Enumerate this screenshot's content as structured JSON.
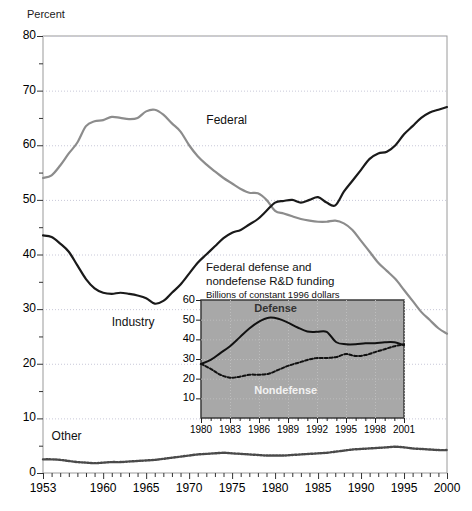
{
  "chart_data": {
    "type": "line",
    "title": "",
    "ylabel": "Percent",
    "xlabel": "",
    "ylim": [
      0,
      80
    ],
    "xlim": [
      1953,
      2000
    ],
    "grid": true,
    "y_ticks": [
      0,
      10,
      20,
      30,
      40,
      50,
      60,
      70,
      80
    ],
    "y_tick_labels": [
      "0",
      "10",
      "20",
      "30",
      "40",
      "50",
      "60",
      "70",
      "80"
    ],
    "x_ticks": [
      1953,
      1960,
      1965,
      1970,
      1975,
      1980,
      1985,
      1990,
      1995,
      2000
    ],
    "x_tick_labels": [
      "1953",
      "1960",
      "1965",
      "1970",
      "1975",
      "1980",
      "1985",
      "1990",
      "1995",
      "2000"
    ],
    "legend_position": "inline-annotation",
    "x": [
      1953,
      1954,
      1955,
      1956,
      1957,
      1958,
      1959,
      1960,
      1961,
      1962,
      1963,
      1964,
      1965,
      1966,
      1967,
      1968,
      1969,
      1970,
      1971,
      1972,
      1973,
      1974,
      1975,
      1976,
      1977,
      1978,
      1979,
      1980,
      1981,
      1982,
      1983,
      1984,
      1985,
      1986,
      1987,
      1988,
      1989,
      1990,
      1991,
      1992,
      1993,
      1994,
      1995,
      1996,
      1997,
      1998,
      1999,
      2000
    ],
    "series": [
      {
        "name": "Federal",
        "color": "#8c8c8c",
        "style": "solid",
        "values": [
          54.0,
          54.5,
          56.3,
          58.5,
          60.5,
          63.5,
          64.4,
          64.6,
          65.2,
          65.0,
          64.8,
          65.0,
          66.2,
          66.5,
          65.6,
          64.0,
          62.5,
          60.0,
          58.0,
          56.5,
          55.2,
          54.0,
          53.0,
          52.0,
          51.3,
          51.2,
          50.0,
          48.0,
          47.5,
          47.0,
          46.5,
          46.2,
          46.0,
          46.0,
          46.2,
          45.7,
          44.5,
          42.5,
          40.5,
          38.5,
          37.0,
          35.5,
          33.5,
          31.5,
          29.5,
          28.0,
          26.5,
          25.5
        ]
      },
      {
        "name": "Industry",
        "color": "#1a1a1a",
        "style": "solid",
        "values": [
          43.5,
          43.2,
          42.0,
          40.5,
          38.0,
          35.5,
          33.8,
          33.0,
          32.8,
          33.0,
          32.8,
          32.5,
          32.0,
          31.0,
          31.5,
          33.0,
          34.5,
          36.5,
          38.5,
          40.0,
          41.5,
          43.0,
          44.0,
          44.5,
          45.5,
          46.5,
          48.0,
          49.5,
          49.8,
          50.0,
          49.5,
          50.0,
          50.5,
          49.5,
          49.0,
          51.5,
          53.5,
          55.5,
          57.5,
          58.5,
          58.8,
          60.0,
          62.0,
          63.5,
          65.0,
          66.0,
          66.5,
          67.0
        ]
      },
      {
        "name": "Other",
        "color": "#4a4a4a",
        "style": "dotted",
        "values": [
          2.5,
          2.5,
          2.4,
          2.2,
          2.0,
          1.9,
          1.8,
          1.9,
          2.0,
          2.0,
          2.1,
          2.2,
          2.3,
          2.4,
          2.6,
          2.8,
          3.0,
          3.2,
          3.4,
          3.5,
          3.6,
          3.7,
          3.6,
          3.5,
          3.4,
          3.3,
          3.2,
          3.2,
          3.2,
          3.3,
          3.4,
          3.5,
          3.6,
          3.7,
          3.9,
          4.1,
          4.3,
          4.4,
          4.5,
          4.6,
          4.7,
          4.8,
          4.7,
          4.5,
          4.4,
          4.3,
          4.2,
          4.2
        ]
      }
    ],
    "annotations": [
      {
        "text": "Federal",
        "x": 1972,
        "y": 64.5
      },
      {
        "text": "Industry",
        "x": 1961,
        "y": 27.5
      },
      {
        "text": "Other",
        "x": 1954,
        "y": 6.5
      }
    ],
    "inset": {
      "type": "line",
      "title_line1": "Federal  defense and",
      "title_line2": "nondefense R&D funding",
      "subtitle": "Billions of constant 1996 dollars",
      "background": "#a8a8a8",
      "ylim": [
        0,
        60
      ],
      "xlim": [
        1980,
        2001
      ],
      "y_ticks": [
        10,
        20,
        30,
        40,
        50,
        60
      ],
      "y_tick_labels": [
        "10",
        "20",
        "30",
        "40",
        "50",
        "60"
      ],
      "x_ticks": [
        1980,
        1983,
        1986,
        1989,
        1992,
        1995,
        1998,
        2001
      ],
      "x_tick_labels": [
        "1980",
        "1983",
        "1986",
        "1989",
        "1992",
        "1995",
        "1998",
        "2001"
      ],
      "x": [
        1980,
        1981,
        1982,
        1983,
        1984,
        1985,
        1986,
        1987,
        1988,
        1989,
        1990,
        1991,
        1992,
        1993,
        1994,
        1995,
        1996,
        1997,
        1998,
        1999,
        2000,
        2001
      ],
      "series": [
        {
          "name": "Defense",
          "color": "#111111",
          "style": "solid",
          "values": [
            27.5,
            29.5,
            33.0,
            36.5,
            41.0,
            45.5,
            49.0,
            51.0,
            50.5,
            48.5,
            46.0,
            44.0,
            43.8,
            43.8,
            38.5,
            37.5,
            37.5,
            38.0,
            38.0,
            38.5,
            38.5,
            37.0
          ]
        },
        {
          "name": "Nondefense",
          "color": "#111111",
          "style": "dashed",
          "values": [
            27.5,
            25.0,
            22.0,
            20.5,
            21.0,
            22.0,
            22.0,
            22.5,
            24.5,
            26.5,
            28.0,
            29.5,
            30.5,
            30.5,
            31.0,
            32.5,
            31.5,
            32.0,
            33.5,
            35.0,
            36.5,
            37.5
          ]
        }
      ],
      "annotations": [
        {
          "text": "Defense",
          "color": "#333333",
          "x": 1988.4,
          "y": 55.5
        },
        {
          "text": "Nondefense",
          "color": "#f2f2f2",
          "x": 1988.4,
          "y": 13.5
        }
      ]
    }
  }
}
